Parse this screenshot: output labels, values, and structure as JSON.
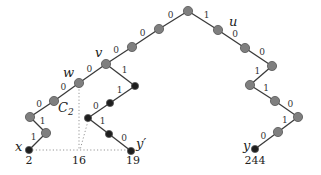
{
  "diagram": {
    "type": "binary-trie",
    "node_colors": {
      "internal": "#7f7f7f",
      "leaf": "#1e1e1e",
      "stroke": "#555555"
    },
    "nodes": [
      {
        "id": "root",
        "x": 188,
        "y": 11,
        "kind": "internal"
      },
      {
        "id": "l1",
        "x": 159,
        "y": 29,
        "kind": "internal"
      },
      {
        "id": "l2",
        "x": 132,
        "y": 47,
        "kind": "internal"
      },
      {
        "id": "v",
        "x": 106,
        "y": 64,
        "kind": "internal",
        "label": "v"
      },
      {
        "id": "w",
        "x": 79,
        "y": 83,
        "kind": "internal",
        "label": "w"
      },
      {
        "id": "c2",
        "x": 54,
        "y": 101,
        "kind": "internal",
        "label": "C2"
      },
      {
        "id": "a1",
        "x": 30,
        "y": 117,
        "kind": "internal"
      },
      {
        "id": "a2",
        "x": 46,
        "y": 133,
        "kind": "internal"
      },
      {
        "id": "x",
        "x": 29,
        "y": 150,
        "kind": "leaf",
        "label": "x",
        "value": "2"
      },
      {
        "id": "m1",
        "x": 135,
        "y": 86,
        "kind": "leaf"
      },
      {
        "id": "m2",
        "x": 110,
        "y": 103,
        "kind": "leaf"
      },
      {
        "id": "m3",
        "x": 88,
        "y": 118,
        "kind": "leaf"
      },
      {
        "id": "m4",
        "x": 109,
        "y": 134,
        "kind": "leaf"
      },
      {
        "id": "yp",
        "x": 131,
        "y": 151,
        "kind": "leaf",
        "label": "y'",
        "value": "19"
      },
      {
        "id": "u",
        "x": 218,
        "y": 30,
        "kind": "internal",
        "label": "u"
      },
      {
        "id": "r2",
        "x": 245,
        "y": 48,
        "kind": "internal"
      },
      {
        "id": "r3",
        "x": 272,
        "y": 66,
        "kind": "internal"
      },
      {
        "id": "r4",
        "x": 250,
        "y": 85,
        "kind": "internal"
      },
      {
        "id": "r5",
        "x": 275,
        "y": 101,
        "kind": "internal"
      },
      {
        "id": "r6",
        "x": 298,
        "y": 117,
        "kind": "internal"
      },
      {
        "id": "r7",
        "x": 278,
        "y": 132,
        "kind": "internal"
      },
      {
        "id": "y",
        "x": 255,
        "y": 149,
        "kind": "leaf",
        "label": "y",
        "value": "244"
      }
    ],
    "edges": [
      {
        "from": "root",
        "to": "l1",
        "bit": "0"
      },
      {
        "from": "l1",
        "to": "l2",
        "bit": "0"
      },
      {
        "from": "l2",
        "to": "v",
        "bit": "0"
      },
      {
        "from": "v",
        "to": "w",
        "bit": "0"
      },
      {
        "from": "w",
        "to": "c2",
        "bit": "0"
      },
      {
        "from": "c2",
        "to": "a1",
        "bit": "0"
      },
      {
        "from": "a1",
        "to": "a2",
        "bit": "1"
      },
      {
        "from": "a2",
        "to": "x",
        "bit": "1"
      },
      {
        "from": "v",
        "to": "m1",
        "bit": "1"
      },
      {
        "from": "m1",
        "to": "m2",
        "bit": "1"
      },
      {
        "from": "m2",
        "to": "m3",
        "bit": "0"
      },
      {
        "from": "m3",
        "to": "m4",
        "bit": "1"
      },
      {
        "from": "m4",
        "to": "yp",
        "bit": "0"
      },
      {
        "from": "root",
        "to": "u",
        "bit": "1"
      },
      {
        "from": "u",
        "to": "r2",
        "bit": "0"
      },
      {
        "from": "r2",
        "to": "r3",
        "bit": "0"
      },
      {
        "from": "r3",
        "to": "r4",
        "bit": "1"
      },
      {
        "from": "r4",
        "to": "r5",
        "bit": "1"
      },
      {
        "from": "r5",
        "to": "r6",
        "bit": "0"
      },
      {
        "from": "r6",
        "to": "r7",
        "bit": "1"
      },
      {
        "from": "r7",
        "to": "y",
        "bit": "0"
      }
    ],
    "dotted_lines": [
      {
        "x1": 79,
        "y1": 86,
        "x2": 79,
        "y2": 150
      },
      {
        "x1": 88,
        "y1": 121,
        "x2": 80,
        "y2": 150
      },
      {
        "x1": 29,
        "y1": 150,
        "x2": 131,
        "y2": 150
      }
    ],
    "axis_values": [
      {
        "text": "2",
        "x": 29,
        "y": 164
      },
      {
        "text": "16",
        "x": 79,
        "y": 164
      },
      {
        "text": "19",
        "x": 133,
        "y": 164
      },
      {
        "text": "244",
        "x": 255,
        "y": 164
      }
    ],
    "labels": {
      "v": "v",
      "w": "w",
      "u": "u",
      "c2_main": "C",
      "c2_sub": "2",
      "x": "x",
      "y": "y",
      "y_prime": "y′"
    }
  }
}
